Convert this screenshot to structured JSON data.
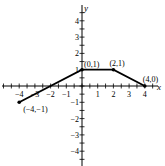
{
  "figure": {
    "label": "2"
  },
  "chart_data": {
    "type": "line",
    "title": "",
    "xlabel": "x",
    "ylabel": "y",
    "xlim": [
      -5,
      5
    ],
    "ylim": [
      -5,
      5
    ],
    "xticks": [
      -4,
      -3,
      -2,
      -1,
      1,
      2,
      3,
      4
    ],
    "yticks": [
      -4,
      -3,
      -2,
      -1,
      1,
      2,
      3,
      4
    ],
    "grid": false,
    "series": [
      {
        "name": "piecewise",
        "x": [
          -4,
          0,
          2,
          4
        ],
        "y": [
          -1,
          1,
          1,
          0
        ]
      }
    ],
    "annotations": [
      {
        "text": "(-4,-1)",
        "x": -4,
        "y": -1
      },
      {
        "text": "(0,1)",
        "x": 0,
        "y": 1
      },
      {
        "text": "(2,1)",
        "x": 2,
        "y": 1
      },
      {
        "text": "(4,0)",
        "x": 4,
        "y": 0
      }
    ]
  }
}
